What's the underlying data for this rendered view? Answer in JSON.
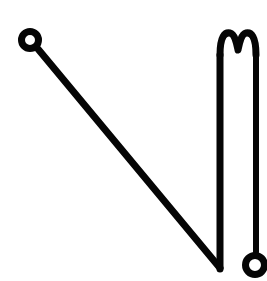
{
  "image": {
    "title": "Pin line drawing",
    "width": 267,
    "height": 281,
    "background_color": "#ffffff",
    "ink_color": "#050505",
    "style": "monochrome hand-drawn contour line art"
  },
  "figure": {
    "name": "safety-pin-outline",
    "parts": [
      {
        "name": "top-left-ring",
        "kind": "ring",
        "center_x": 30,
        "center_y": 40,
        "outer_radius": 12,
        "inner_radius": 5,
        "stroke_width": 7
      },
      {
        "name": "diagonal-shaft",
        "kind": "line",
        "x1": 38,
        "y1": 49,
        "x2": 219,
        "y2": 268,
        "stroke_width": 7
      },
      {
        "name": "v-apex",
        "kind": "vertex",
        "x": 220,
        "y": 269
      },
      {
        "name": "left-vertical-of-loop",
        "kind": "line",
        "x1": 220,
        "y1": 268,
        "x2": 220,
        "y2": 52,
        "stroke_width": 7
      },
      {
        "name": "double-hump-top",
        "kind": "curve",
        "left_hump_peak_x": 228,
        "left_hump_peak_y": 35,
        "notch_x": 238,
        "notch_y": 51,
        "right_hump_peak_x": 248,
        "right_hump_peak_y": 35,
        "stroke_width": 7
      },
      {
        "name": "right-vertical-of-loop",
        "kind": "line",
        "x1": 256,
        "y1": 50,
        "x2": 256,
        "y2": 252,
        "stroke_width": 6
      },
      {
        "name": "bottom-right-ring",
        "kind": "ring",
        "center_x": 255,
        "center_y": 265,
        "outer_radius": 13,
        "inner_radius": 6,
        "stroke_width": 7
      }
    ]
  },
  "geometry": {
    "paths": {
      "diagonal_shaft": "M38,49 L220,268",
      "loop_left_vertical": "M220,269 L220,55",
      "loop_top_hump": "M220,55 C220,36 225,32 230,33 C235,34 237,45 238,50 C239,45 241,34 246,33 C251,32 256,36 256,55",
      "loop_right_vertical": "M256,55 L256,252"
    }
  },
  "metrics": {
    "stroke_width_main": 7,
    "stroke_width_thin": 6
  }
}
